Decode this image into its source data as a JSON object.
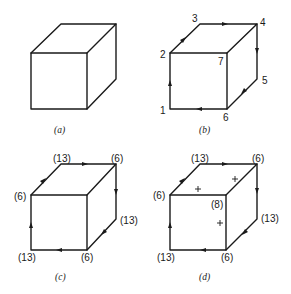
{
  "figure": {
    "panels": [
      {
        "id": "a",
        "caption": "(a)",
        "description": "Plain cube outline"
      },
      {
        "id": "b",
        "caption": "(b)",
        "vertex_labels": {
          "v1": "1",
          "v2": "2",
          "v3": "3",
          "v4": "4",
          "v5": "5",
          "v6": "6",
          "v7": "7"
        },
        "path": "1→2→3→4→5→6→1"
      },
      {
        "id": "c",
        "caption": "(c)",
        "vertex_labels": {
          "v1": "(13)",
          "v2": "(6)",
          "v3": "(13)",
          "v4": "(6)",
          "v5": "(13)",
          "v6": "(6)"
        }
      },
      {
        "id": "d",
        "caption": "(d)",
        "vertex_labels": {
          "v1": "(13)",
          "v2": "(6)",
          "v3": "(13)",
          "v4": "(6)",
          "v5": "(13)",
          "v6": "(6)",
          "v7": "(8)"
        },
        "face_marks": {
          "top_left": "+",
          "top_right": "+",
          "front": "+"
        }
      }
    ]
  },
  "colors": {
    "line": "#1a1a1a",
    "background": "#ffffff"
  }
}
